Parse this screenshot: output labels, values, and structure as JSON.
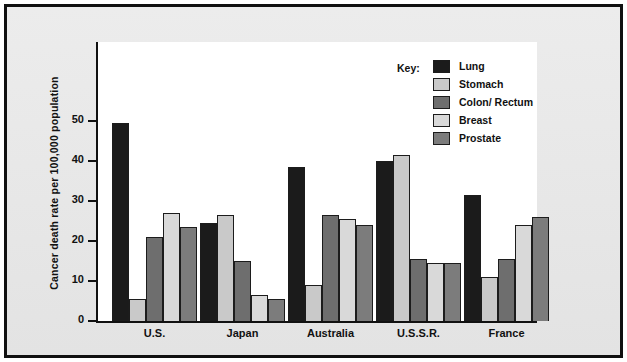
{
  "chart_data": {
    "type": "bar",
    "title": "",
    "xlabel": "",
    "ylabel": "Cancer death rate per 100,000 population",
    "ylim": [
      0,
      55
    ],
    "yticks": [
      0,
      10,
      20,
      30,
      40,
      50
    ],
    "ytick_labels": [
      "0",
      "10",
      "20",
      "30",
      "40",
      "50"
    ],
    "grid": false,
    "legend_position": "top-right",
    "legend_title": "Key:",
    "categories": [
      "U.S.",
      "Japan",
      "Australia",
      "U.S.S.R.",
      "France"
    ],
    "series": [
      {
        "name": "Lung",
        "color": "#1b1b1b",
        "values": [
          49.5,
          24.5,
          38.5,
          40.0,
          31.5
        ]
      },
      {
        "name": "Stomach",
        "color": "#c9c9c9",
        "values": [
          5.5,
          26.5,
          9.0,
          41.5,
          11.0
        ]
      },
      {
        "name": "Colon/ Rectum",
        "color": "#6e6e6e",
        "values": [
          21.0,
          15.0,
          26.5,
          15.5,
          15.5
        ]
      },
      {
        "name": "Breast",
        "color": "#d9d9d9",
        "values": [
          27.0,
          6.5,
          25.5,
          14.5,
          24.0
        ]
      },
      {
        "name": "Prostate",
        "color": "#7c7c7c",
        "values": [
          23.5,
          5.5,
          24.0,
          14.5,
          26.0
        ]
      }
    ]
  },
  "colors": {
    "frame": "#101010",
    "paper": "#e9e9e9",
    "plot_background": "#ffffff",
    "axis": "#111111",
    "bar_outline": "#1c1c1c"
  }
}
